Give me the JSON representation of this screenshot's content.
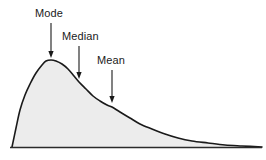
{
  "figure": {
    "title": "",
    "background_color": "#ffffff"
  },
  "annotations": [
    {
      "id": "mode",
      "label": "Mode",
      "label_x": 35,
      "label_y": 7,
      "arrow_x": 51,
      "arrow_top_y": 23,
      "arrow_tip_y": 58
    },
    {
      "id": "median",
      "label": "Median",
      "label_x": 62,
      "label_y": 30,
      "arrow_x": 79,
      "arrow_top_y": 46,
      "arrow_tip_y": 79
    },
    {
      "id": "mean",
      "label": "Mean",
      "label_x": 97,
      "label_y": 54,
      "arrow_x": 112,
      "arrow_top_y": 70,
      "arrow_tip_y": 103
    }
  ],
  "chart_data": {
    "type": "area",
    "title": "",
    "subtitle": "",
    "xlabel": "",
    "ylabel": "",
    "grid": false,
    "legend": null,
    "skew": "right",
    "axis_baseline_y": 147,
    "xlim": [
      0,
      266
    ],
    "ylim": [
      0,
      160
    ],
    "curve_color": "#1a1a1a",
    "fill_color": "#ececec",
    "baseline_color": "#2b2b2b",
    "markers": [
      {
        "name": "Mode",
        "x": 51,
        "y_curve": 60
      },
      {
        "name": "Median",
        "x": 79,
        "y_curve": 82
      },
      {
        "name": "Mean",
        "x": 112,
        "y_curve": 106
      }
    ],
    "x": [
      12,
      16,
      20,
      25,
      30,
      36,
      42,
      46,
      51,
      56,
      62,
      68,
      74,
      79,
      86,
      93,
      100,
      107,
      112,
      120,
      130,
      140,
      152,
      165,
      178,
      192,
      208,
      225,
      242,
      262
    ],
    "y": [
      147,
      128,
      110,
      95,
      84,
      73,
      65,
      61,
      60,
      61,
      64,
      69,
      76,
      82,
      89,
      96,
      101,
      105,
      107,
      112,
      118,
      124,
      129,
      134,
      138,
      141,
      143,
      145,
      146,
      147
    ],
    "values_normalized": [
      0.0,
      0.14,
      0.27,
      0.39,
      0.47,
      0.55,
      0.61,
      0.64,
      0.65,
      0.64,
      0.62,
      0.58,
      0.53,
      0.48,
      0.43,
      0.38,
      0.34,
      0.31,
      0.29,
      0.26,
      0.22,
      0.17,
      0.13,
      0.1,
      0.07,
      0.04,
      0.03,
      0.02,
      0.01,
      0.0
    ]
  }
}
